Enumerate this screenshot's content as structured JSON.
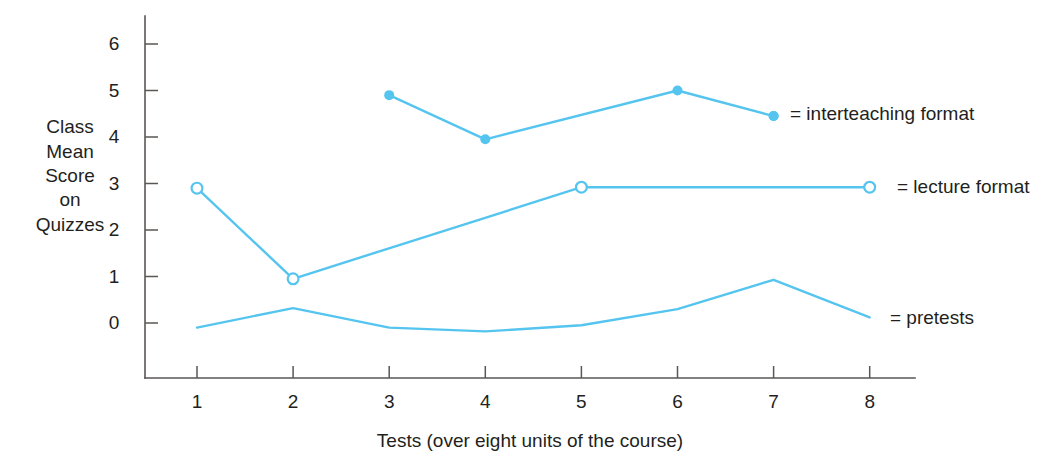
{
  "chart_data": {
    "type": "line",
    "title": "",
    "xlabel": "Tests (over eight units of the course)",
    "ylabel": "Class Mean Score on Quizzes",
    "ylabel_lines": [
      "Class",
      "Mean",
      "Score",
      "on",
      "Quizzes"
    ],
    "x": [
      1,
      2,
      3,
      4,
      5,
      6,
      7,
      8
    ],
    "xtick_labels": [
      "1",
      "2",
      "3",
      "4",
      "5",
      "6",
      "7",
      "8"
    ],
    "ytick_labels": [
      "0",
      "1",
      "2",
      "3",
      "4",
      "5",
      "6"
    ],
    "yticks": [
      0,
      1,
      2,
      3,
      4,
      5,
      6
    ],
    "xlim": [
      0.6,
      8.4
    ],
    "ylim": [
      -0.55,
      6.6
    ],
    "grid": false,
    "legend_position": "right-inline",
    "line_color": "#55c5f0",
    "axis_color": "#5a5755",
    "text_color": "#231f20",
    "background": "#ffffff",
    "series": [
      {
        "name": "interteaching format",
        "legend_label": "= interteaching format",
        "marker": "filled-circle",
        "color": "#55c5f0",
        "x": [
          3,
          4,
          6,
          7
        ],
        "values": [
          4.9,
          3.95,
          5.0,
          4.45
        ]
      },
      {
        "name": "lecture format",
        "legend_label": "= lecture format",
        "marker": "open-circle",
        "color": "#55c5f0",
        "x": [
          1,
          2,
          5,
          8
        ],
        "values": [
          2.9,
          0.95,
          2.92,
          2.92
        ]
      },
      {
        "name": "pretests",
        "legend_label": "= pretests",
        "marker": "none",
        "color": "#55c5f0",
        "x": [
          1,
          2,
          3,
          4,
          5,
          6,
          7,
          8
        ],
        "values": [
          -0.1,
          0.32,
          -0.1,
          -0.18,
          -0.05,
          0.3,
          0.93,
          0.12
        ]
      }
    ]
  }
}
